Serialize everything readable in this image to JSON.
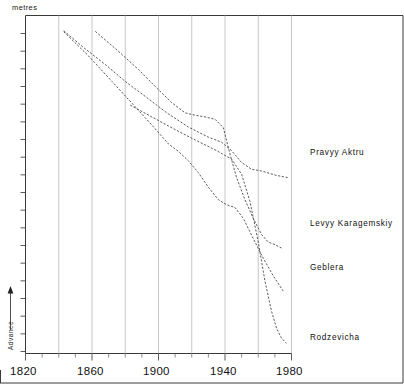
{
  "chart_data": {
    "type": "line",
    "title": "",
    "xlabel": "",
    "ylabel": "metres",
    "ylabel_text": "metres",
    "y_direction_label": "Advance",
    "y_direction_arrow": "up-arrow",
    "xlim": [
      1820,
      1980
    ],
    "ylim": [
      0,
      1
    ],
    "grid": "vertical-major-every-20-years",
    "legend_position": "right-inline-labels",
    "x_ticks_major": [
      1820,
      1860,
      1900,
      1940,
      1980
    ],
    "x_tick_labels": [
      "1820",
      "1860",
      "1900",
      "1940",
      "1980"
    ],
    "x_ticks_minor": [
      1830,
      1840,
      1850,
      1870,
      1880,
      1890,
      1910,
      1920,
      1930,
      1950,
      1960,
      1970
    ],
    "y_tick_count": 19,
    "series": [
      {
        "name": "Pravyy Aktru",
        "label": "Pravyy  Aktru",
        "label_x": 1985,
        "style": "dashed",
        "points": [
          [
            1843,
            0.955
          ],
          [
            1855,
            0.905
          ],
          [
            1868,
            0.855
          ],
          [
            1880,
            0.805
          ],
          [
            1893,
            0.757
          ],
          [
            1905,
            0.712
          ],
          [
            1918,
            0.67
          ],
          [
            1930,
            0.64
          ],
          [
            1938,
            0.625
          ],
          [
            1944,
            0.6
          ],
          [
            1950,
            0.565
          ],
          [
            1956,
            0.545
          ],
          [
            1962,
            0.54
          ],
          [
            1970,
            0.528
          ],
          [
            1978,
            0.52
          ]
        ]
      },
      {
        "name": "Levyy Karagemskiy",
        "label": "Levyy  Karagemskiy",
        "label_x": 1985,
        "style": "dashed",
        "points": [
          [
            1862,
            0.953
          ],
          [
            1875,
            0.898
          ],
          [
            1888,
            0.84
          ],
          [
            1898,
            0.79
          ],
          [
            1908,
            0.742
          ],
          [
            1916,
            0.712
          ],
          [
            1922,
            0.705
          ],
          [
            1928,
            0.7
          ],
          [
            1934,
            0.693
          ],
          [
            1939,
            0.668
          ],
          [
            1943,
            0.59
          ],
          [
            1947,
            0.52
          ],
          [
            1952,
            0.455
          ],
          [
            1957,
            0.4
          ],
          [
            1962,
            0.352
          ],
          [
            1966,
            0.33
          ],
          [
            1970,
            0.322
          ],
          [
            1974,
            0.312
          ]
        ]
      },
      {
        "name": "Geblera",
        "label": "Geblera",
        "label_x": 1985,
        "style": "dashed",
        "points": [
          [
            1843,
            0.952
          ],
          [
            1858,
            0.88
          ],
          [
            1872,
            0.805
          ],
          [
            1886,
            0.73
          ],
          [
            1898,
            0.665
          ],
          [
            1906,
            0.62
          ],
          [
            1912,
            0.598
          ],
          [
            1918,
            0.57
          ],
          [
            1924,
            0.535
          ],
          [
            1930,
            0.492
          ],
          [
            1936,
            0.455
          ],
          [
            1941,
            0.44
          ],
          [
            1946,
            0.432
          ],
          [
            1951,
            0.4
          ],
          [
            1957,
            0.34
          ],
          [
            1963,
            0.282
          ],
          [
            1969,
            0.23
          ],
          [
            1975,
            0.185
          ]
        ]
      },
      {
        "name": "Rodzevicha",
        "label": "Rodzevicha",
        "label_x": 1985,
        "style": "dashed",
        "points": [
          [
            1883,
            0.735
          ],
          [
            1896,
            0.7
          ],
          [
            1909,
            0.665
          ],
          [
            1922,
            0.632
          ],
          [
            1935,
            0.6
          ],
          [
            1944,
            0.575
          ],
          [
            1950,
            0.53
          ],
          [
            1955,
            0.45
          ],
          [
            1960,
            0.33
          ],
          [
            1964,
            0.215
          ],
          [
            1968,
            0.125
          ],
          [
            1971,
            0.075
          ],
          [
            1974,
            0.045
          ],
          [
            1977,
            0.03
          ]
        ]
      }
    ]
  },
  "labels": {
    "unit_top": "metres",
    "advance": "Advance",
    "series": {
      "pravyy_aktru": "Pravyy  Aktru",
      "levyy_karagemskiy": "Levyy  Karagemskiy",
      "geblera": "Geblera",
      "rodzevicha": "Rodzevicha"
    },
    "x_axis": {
      "t1820": "1820",
      "t1860": "1860",
      "t1900": "1900",
      "t1940": "1940",
      "t1980": "1980"
    }
  },
  "colors": {
    "background": "#ffffff",
    "axis": "#3a3a3a",
    "grid": "#b9b9b9",
    "curve": "#4a4a4a",
    "text": "#111111"
  }
}
